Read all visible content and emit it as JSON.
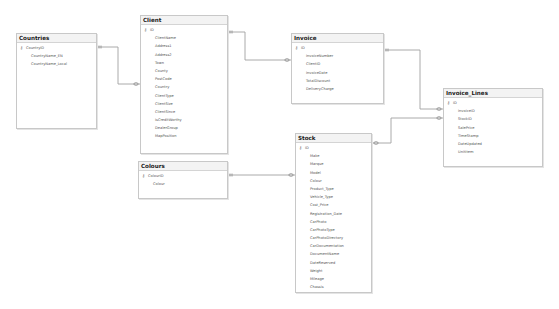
{
  "diagram": {
    "tables": {
      "countries": {
        "title": "Countries",
        "fields": [
          "CountryID",
          "CountryName_EN",
          "CountryName_Local"
        ],
        "primary_key": "CountryID"
      },
      "client": {
        "title": "Client",
        "fields": [
          "ID",
          "ClientName",
          "Address1",
          "Address2",
          "Town",
          "County",
          "PostCode",
          "Country",
          "ClientType",
          "ClientSize",
          "ClientSince",
          "IsCreditWorthy",
          "DealerGroup",
          "MapPosition"
        ],
        "primary_key": "ID"
      },
      "invoice": {
        "title": "Invoice",
        "fields": [
          "ID",
          "InvoiceNumber",
          "ClientID",
          "InvoiceDate",
          "TotalDiscount",
          "DeliveryCharge"
        ],
        "primary_key": "ID"
      },
      "invoice_lines": {
        "title": "Invoice_Lines",
        "fields": [
          "ID",
          "InvoiceID",
          "StockID",
          "SalePrice",
          "TimeStamp",
          "DateUpdated",
          "UnitItem"
        ],
        "primary_key": "ID"
      },
      "colours": {
        "title": "Colours",
        "fields": [
          "ColourID",
          "Colour"
        ],
        "primary_key": "ColourID"
      },
      "stock": {
        "title": "Stock",
        "fields": [
          "ID",
          "Make",
          "Marque",
          "Model",
          "Colour",
          "Product_Type",
          "Vehicle_Type",
          "Cost_Price",
          "Registration_Date",
          "CarPhoto",
          "CarPhotoType",
          "CarPhotoDirectory",
          "CarDocumentation",
          "DocumentName",
          "DateReserved",
          "Weight",
          "Mileage",
          "Chassis"
        ],
        "primary_key": "ID"
      }
    },
    "relationships": [
      {
        "from": "Countries",
        "to": "Client"
      },
      {
        "from": "Client",
        "to": "Invoice"
      },
      {
        "from": "Invoice",
        "to": "Invoice_Lines"
      },
      {
        "from": "Stock",
        "to": "Invoice_Lines"
      },
      {
        "from": "Colours",
        "to": "Stock"
      }
    ],
    "key_icon": "key-icon",
    "colors": {
      "line": "#a0a0a0",
      "border": "#c8c8c8",
      "title_bg": "#f3f3f3"
    }
  }
}
